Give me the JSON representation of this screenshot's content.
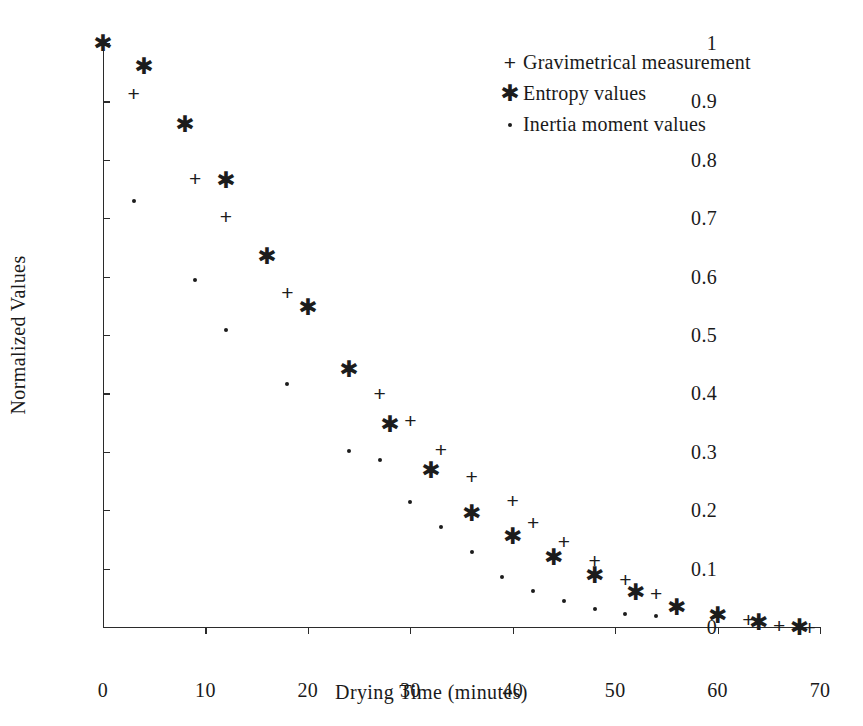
{
  "chart_data": {
    "type": "scatter",
    "title": "",
    "xlabel": "Drying Time (minutes)",
    "ylabel": "Normalized Values",
    "xlim": [
      0,
      70
    ],
    "ylim": [
      0,
      1
    ],
    "xticks": [
      "0",
      "10",
      "20",
      "30",
      "40",
      "50",
      "60",
      "70"
    ],
    "xtick_values": [
      0,
      10,
      20,
      30,
      40,
      50,
      60,
      70
    ],
    "yticks": [
      "0",
      "0.1",
      "0.2",
      "0.3",
      "0.4",
      "0.5",
      "0.6",
      "0.7",
      "0.8",
      "0.9",
      "1"
    ],
    "ytick_values": [
      0,
      0.1,
      0.2,
      0.3,
      0.4,
      0.5,
      0.6,
      0.7,
      0.8,
      0.9,
      1
    ],
    "grid": false,
    "legend_position": "upper right",
    "series": [
      {
        "name": "Gravimetrical measurement",
        "marker": "plus",
        "color": "#1c1c1c",
        "points": [
          [
            3,
            0.915
          ],
          [
            9,
            0.768
          ],
          [
            12,
            0.703
          ],
          [
            18,
            0.574
          ],
          [
            27,
            0.4
          ],
          [
            30,
            0.354
          ],
          [
            33,
            0.304
          ],
          [
            36,
            0.258
          ],
          [
            40,
            0.218
          ],
          [
            42,
            0.18
          ],
          [
            45,
            0.148
          ],
          [
            48,
            0.115
          ],
          [
            51,
            0.083
          ],
          [
            54,
            0.058
          ],
          [
            60,
            0.021
          ],
          [
            63,
            0.013
          ],
          [
            66,
            0.003
          ],
          [
            69,
            0.0
          ]
        ]
      },
      {
        "name": "Entropy values",
        "marker": "asterisk",
        "color": "#1c1c1c",
        "points": [
          [
            0,
            1.0
          ],
          [
            4,
            0.961
          ],
          [
            8,
            0.861
          ],
          [
            12,
            0.765
          ],
          [
            16,
            0.635
          ],
          [
            20,
            0.548
          ],
          [
            24,
            0.442
          ],
          [
            28,
            0.348
          ],
          [
            32,
            0.269
          ],
          [
            36,
            0.195
          ],
          [
            40,
            0.156
          ],
          [
            44,
            0.12
          ],
          [
            48,
            0.089
          ],
          [
            52,
            0.06
          ],
          [
            56,
            0.034
          ],
          [
            60,
            0.02
          ],
          [
            64,
            0.008
          ],
          [
            68,
            0.0
          ]
        ]
      },
      {
        "name": "Inertia moment values",
        "marker": "dot",
        "color": "#1c1c1c",
        "points": [
          [
            3,
            0.73
          ],
          [
            9,
            0.595
          ],
          [
            12,
            0.509
          ],
          [
            18,
            0.416
          ],
          [
            24,
            0.301
          ],
          [
            27,
            0.286
          ],
          [
            30,
            0.214
          ],
          [
            33,
            0.172
          ],
          [
            36,
            0.129
          ],
          [
            39,
            0.086
          ],
          [
            42,
            0.062
          ],
          [
            45,
            0.044
          ],
          [
            48,
            0.031
          ],
          [
            51,
            0.023
          ],
          [
            54,
            0.018
          ]
        ]
      }
    ]
  },
  "legend": {
    "items": [
      {
        "marker_glyph": "+",
        "marker_name": "plus-marker-icon",
        "label": "Gravimetrical measurement"
      },
      {
        "marker_glyph": "✱",
        "marker_name": "asterisk-marker-icon",
        "label": "Entropy values"
      },
      {
        "marker_glyph": "·",
        "marker_name": "dot-marker-icon",
        "label": "Inertia moment values"
      }
    ]
  }
}
